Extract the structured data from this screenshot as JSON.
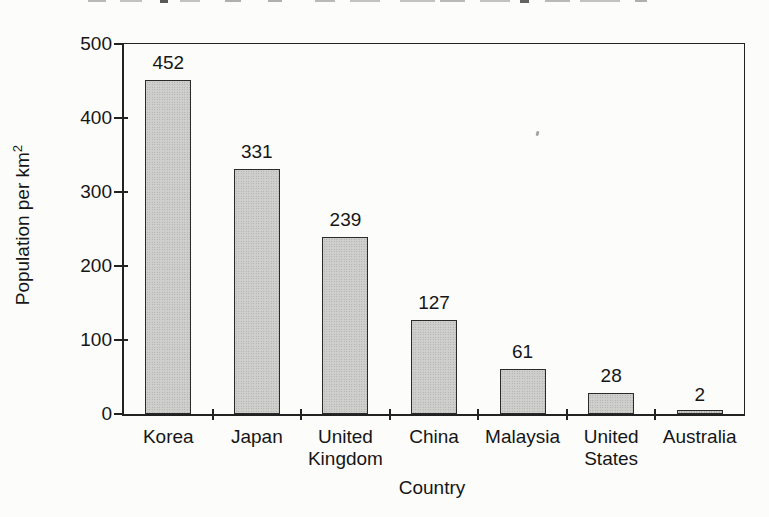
{
  "chart_data": {
    "type": "bar",
    "title": "",
    "categories": [
      "Korea",
      "Japan",
      "United Kingdom",
      "China",
      "Malaysia",
      "United States",
      "Australia"
    ],
    "values": [
      452,
      331,
      239,
      127,
      61,
      28,
      2
    ],
    "value_labels": [
      "452",
      "331",
      "239",
      "127",
      "61",
      "28",
      "2"
    ],
    "xlabel": "Country",
    "ylabel": "Population per km²",
    "ylim": [
      0,
      500
    ],
    "yticks": [
      0,
      100,
      200,
      300,
      400,
      500
    ],
    "grid": false,
    "legend": null,
    "colors": {
      "bar_fill": "#cfcfcd",
      "bar_stipple": "#9f9f9d",
      "bar_border": "#2a2a2a",
      "axis": "#222222",
      "text": "#161616",
      "background": "#fcfcfa"
    }
  }
}
